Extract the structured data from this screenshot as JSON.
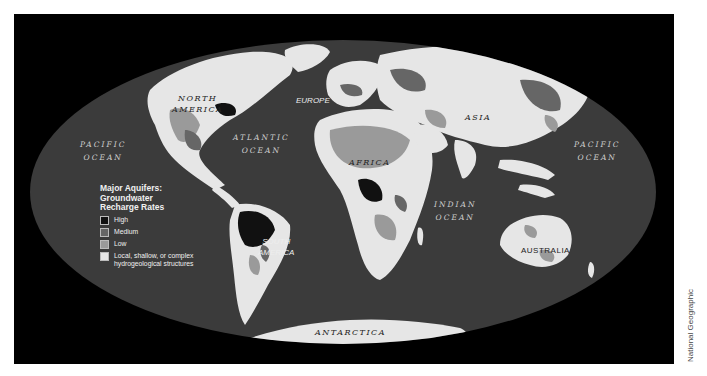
{
  "map": {
    "projection": "elliptical world map",
    "colors": {
      "frame": "#000000",
      "ocean": "#3b3b3b",
      "high": "#111111",
      "medium": "#666666",
      "low": "#9a9a9a",
      "local": "#e6e6e6"
    },
    "oceans": [
      {
        "id": "pacific-west",
        "line1": "PACIFIC",
        "line2": "OCEAN"
      },
      {
        "id": "atlantic",
        "line1": "ATLANTIC",
        "line2": "OCEAN"
      },
      {
        "id": "indian",
        "line1": "INDIAN",
        "line2": "OCEAN"
      },
      {
        "id": "pacific-east",
        "line1": "PACIFIC",
        "line2": "OCEAN"
      }
    ],
    "continents": [
      {
        "id": "north-america",
        "line1": "NORTH",
        "line2": "AMERICA"
      },
      {
        "id": "europe",
        "line1": "EUROPE"
      },
      {
        "id": "asia",
        "line1": "ASIA"
      },
      {
        "id": "africa",
        "line1": "AFRICA"
      },
      {
        "id": "south-america",
        "line1": "SOUTH",
        "line2": "AMERICA"
      },
      {
        "id": "australia",
        "line1": "AUSTRALIA"
      },
      {
        "id": "antarctica",
        "line1": "ANTARCTICA"
      }
    ]
  },
  "legend": {
    "title_line1": "Major Aquifers:",
    "title_line2": "Groundwater",
    "title_line3": "Recharge Rates",
    "items": [
      {
        "label": "High",
        "color": "#111111"
      },
      {
        "label": "Medium",
        "color": "#666666"
      },
      {
        "label": "Low",
        "color": "#9a9a9a"
      },
      {
        "label": "Local, shallow, or complex",
        "label2": "hydrogeological structures",
        "color": "#e6e6e6"
      }
    ]
  },
  "credit": "National Geographic"
}
